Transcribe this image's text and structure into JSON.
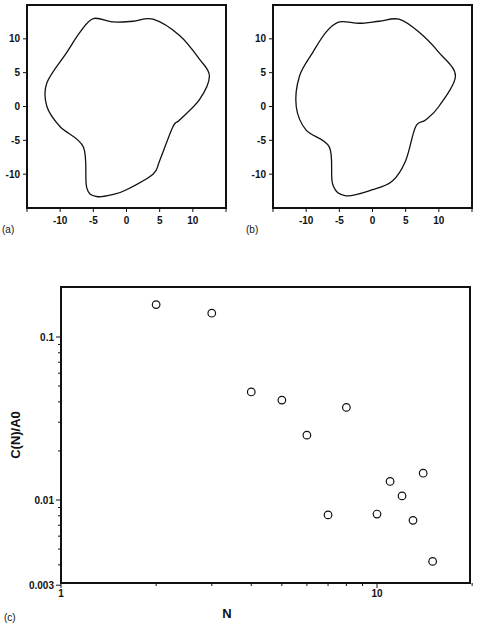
{
  "panels": {
    "a": {
      "label": "(a)",
      "x_ticks": [
        "-10",
        "-5",
        "0",
        "5",
        "10"
      ],
      "y_ticks": [
        "10",
        "5",
        "0",
        "-5",
        "-10"
      ]
    },
    "b": {
      "label": "(b)",
      "x_ticks": [
        "-10",
        "-5",
        "0",
        "5",
        "10"
      ],
      "y_ticks": [
        "10",
        "5",
        "0",
        "-5",
        "-10"
      ]
    },
    "c": {
      "label": "(c)",
      "xlabel": "N",
      "ylabel": "C(N)/A0",
      "x_ticks": [
        "1",
        "10"
      ],
      "y_ticks": [
        "0.1",
        "0.01",
        "0.003"
      ]
    }
  },
  "chart_data": [
    {
      "type": "line",
      "title": "(a) closed contour outline",
      "xlim": [
        -15,
        15
      ],
      "ylim": [
        -15,
        15
      ],
      "x_ticks": [
        -10,
        -5,
        0,
        5,
        10
      ],
      "y_ticks": [
        -10,
        -5,
        0,
        5,
        10
      ],
      "series": [
        {
          "name": "outline a",
          "points": [
            [
              -5,
              13
            ],
            [
              -2,
              12.5
            ],
            [
              1,
              12.6
            ],
            [
              4,
              12.9
            ],
            [
              8,
              10.5
            ],
            [
              11,
              7
            ],
            [
              12.5,
              4.5
            ],
            [
              11,
              1
            ],
            [
              8,
              -2
            ],
            [
              7,
              -3
            ],
            [
              5,
              -8
            ],
            [
              4,
              -10
            ],
            [
              0,
              -12.3
            ],
            [
              -2,
              -13
            ],
            [
              -4.5,
              -13.3
            ],
            [
              -6,
              -12
            ],
            [
              -6.5,
              -6
            ],
            [
              -10,
              -3
            ],
            [
              -12,
              0
            ],
            [
              -12,
              3.5
            ],
            [
              -9,
              8
            ],
            [
              -7,
              11
            ],
            [
              -5,
              13
            ]
          ]
        }
      ]
    },
    {
      "type": "line",
      "title": "(b) smoothed closed contour outline",
      "xlim": [
        -15,
        15
      ],
      "ylim": [
        -15,
        15
      ],
      "x_ticks": [
        -10,
        -5,
        0,
        5,
        10
      ],
      "y_ticks": [
        -10,
        -5,
        0,
        5,
        10
      ],
      "series": [
        {
          "name": "outline b",
          "points": [
            [
              -5,
              12.5
            ],
            [
              -2,
              12.3
            ],
            [
              1,
              12.6
            ],
            [
              4,
              12.9
            ],
            [
              7,
              11
            ],
            [
              10,
              8
            ],
            [
              12.5,
              4.5
            ],
            [
              10,
              0
            ],
            [
              8,
              -2
            ],
            [
              6.5,
              -3
            ],
            [
              5,
              -8
            ],
            [
              3,
              -11
            ],
            [
              0,
              -12.3
            ],
            [
              -4,
              -13.2
            ],
            [
              -6,
              -11.5
            ],
            [
              -6.5,
              -6
            ],
            [
              -10,
              -3.5
            ],
            [
              -11.5,
              0
            ],
            [
              -11,
              4.5
            ],
            [
              -9,
              8
            ],
            [
              -7,
              11
            ],
            [
              -5,
              12.5
            ]
          ]
        }
      ]
    },
    {
      "type": "scatter",
      "title": "",
      "xlabel": "N",
      "ylabel": "C(N)/A0",
      "x_scale": "log",
      "y_scale": "log",
      "xlim": [
        1,
        20
      ],
      "ylim": [
        0.003,
        0.2
      ],
      "x_tick_labels": [
        "1",
        "10"
      ],
      "y_tick_labels": [
        "0.1",
        "0.01",
        "0.003"
      ],
      "marker": "open-circle",
      "series": [
        {
          "name": "C(N)/A0",
          "x": [
            2,
            3,
            4,
            5,
            6,
            7,
            8,
            10,
            11,
            12,
            13,
            14,
            15
          ],
          "y": [
            0.158,
            0.14,
            0.046,
            0.041,
            0.025,
            0.0081,
            0.037,
            0.0082,
            0.013,
            0.0106,
            0.0075,
            0.0146,
            0.0042
          ]
        }
      ]
    }
  ]
}
